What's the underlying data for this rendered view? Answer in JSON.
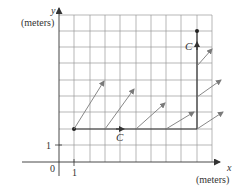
{
  "axes": {
    "y_label": "y",
    "y_unit": "(meters)",
    "x_label": "x",
    "x_unit": "(meters)",
    "origin_label": "0",
    "x_tick_label": "1",
    "y_tick_label": "1"
  },
  "path": {
    "label_bottom": "C",
    "label_right": "C",
    "start": [
      1,
      2
    ],
    "corner": [
      9,
      2
    ],
    "end": [
      9,
      8
    ]
  },
  "grid": {
    "x_min": 0,
    "x_max": 10,
    "y_min": 0,
    "y_max": 9
  },
  "vectors": [
    {
      "at": [
        1,
        2
      ],
      "to": [
        74,
        129,
        104,
        81
      ]
    },
    {
      "at": [
        3,
        2
      ],
      "to": [
        105,
        129,
        134,
        89
      ]
    },
    {
      "at": [
        5,
        2
      ],
      "to": [
        136,
        129,
        165,
        103
      ]
    },
    {
      "at": [
        7,
        2
      ],
      "to": [
        166,
        129,
        194,
        112
      ]
    },
    {
      "at": [
        9,
        2
      ],
      "to": [
        197,
        129,
        223,
        112
      ]
    },
    {
      "at": [
        9,
        4
      ],
      "to": [
        197,
        97,
        221,
        80
      ]
    },
    {
      "at": [
        9,
        6
      ],
      "to": [
        197,
        66,
        212,
        49
      ]
    }
  ],
  "colors": {
    "grid": "#8a8a8a",
    "axis": "#333333",
    "path": "#333333",
    "arrow": "#7a7a7a"
  }
}
